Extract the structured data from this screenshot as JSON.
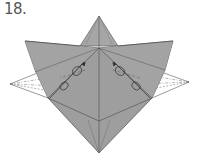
{
  "step": {
    "label": "18."
  },
  "colors": {
    "paper": "#9e9e9e",
    "paper_light": "#a8a8a8",
    "line": "#4a4a4a",
    "back_flap": "#ffffff"
  }
}
